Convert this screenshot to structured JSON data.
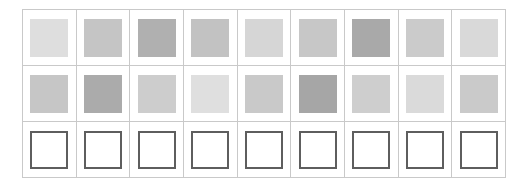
{
  "grid": {
    "columns": 9,
    "rows": 3,
    "grid_line_color": "#c9c9c9",
    "background_color": "#ffffff",
    "outline_color": "#5e5e5e",
    "rows_data": [
      {
        "name": "row-1-gray-swatches",
        "type": "filled",
        "cells": [
          {
            "name": "swatch-r1c1",
            "color": "#dedede"
          },
          {
            "name": "swatch-r1c2",
            "color": "#c5c5c5"
          },
          {
            "name": "swatch-r1c3",
            "color": "#b0b0b0"
          },
          {
            "name": "swatch-r1c4",
            "color": "#c2c2c2"
          },
          {
            "name": "swatch-r1c5",
            "color": "#d6d6d6"
          },
          {
            "name": "swatch-r1c6",
            "color": "#c7c7c7"
          },
          {
            "name": "swatch-r1c7",
            "color": "#a9a9a9"
          },
          {
            "name": "swatch-r1c8",
            "color": "#cbcbcb"
          },
          {
            "name": "swatch-r1c9",
            "color": "#d9d9d9"
          }
        ]
      },
      {
        "name": "row-2-gray-swatches",
        "type": "filled",
        "cells": [
          {
            "name": "swatch-r2c1",
            "color": "#c6c6c6"
          },
          {
            "name": "swatch-r2c2",
            "color": "#ababab"
          },
          {
            "name": "swatch-r2c3",
            "color": "#cdcdcd"
          },
          {
            "name": "swatch-r2c4",
            "color": "#dfdfdf"
          },
          {
            "name": "swatch-r2c5",
            "color": "#c9c9c9"
          },
          {
            "name": "swatch-r2c6",
            "color": "#a6a6a6"
          },
          {
            "name": "swatch-r2c7",
            "color": "#cecece"
          },
          {
            "name": "swatch-r2c8",
            "color": "#dadada"
          },
          {
            "name": "swatch-r2c9",
            "color": "#cacaca"
          }
        ]
      },
      {
        "name": "row-3-outlined-squares",
        "type": "outlined",
        "cells": [
          {
            "name": "outline-r3c1",
            "color": "#ffffff"
          },
          {
            "name": "outline-r3c2",
            "color": "#ffffff"
          },
          {
            "name": "outline-r3c3",
            "color": "#ffffff"
          },
          {
            "name": "outline-r3c4",
            "color": "#ffffff"
          },
          {
            "name": "outline-r3c5",
            "color": "#ffffff"
          },
          {
            "name": "outline-r3c6",
            "color": "#ffffff"
          },
          {
            "name": "outline-r3c7",
            "color": "#ffffff"
          },
          {
            "name": "outline-r3c8",
            "color": "#ffffff"
          },
          {
            "name": "outline-r3c9",
            "color": "#ffffff"
          }
        ]
      }
    ]
  }
}
